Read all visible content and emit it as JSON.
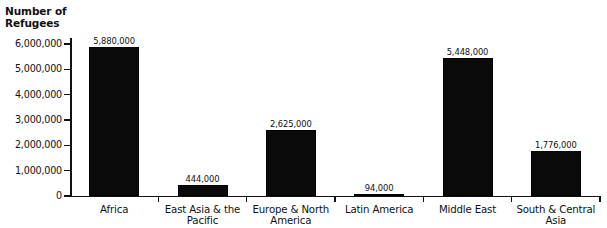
{
  "chart_data": {
    "type": "bar",
    "title": "",
    "xlabel": "",
    "ylabel": "Number of\nRefugees",
    "ylim": [
      0,
      6000000
    ],
    "ytick_labels": [
      "6,000,000",
      "5,000,000",
      "4,000,000",
      "3,000,000",
      "2,000,000",
      "1,000,000",
      "0"
    ],
    "ytick_values": [
      6000000,
      5000000,
      4000000,
      3000000,
      2000000,
      1000000,
      0
    ],
    "grid": false,
    "legend": "none",
    "bar_color": "#0a0a0a",
    "categories": [
      "Africa",
      "East Asia & the\nPacific",
      "Europe & North\nAmerica",
      "Latin America",
      "Middle East",
      "South & Central\nAsia"
    ],
    "values": [
      5880000,
      444000,
      2625000,
      94000,
      5448000,
      1776000
    ],
    "value_labels": [
      "5,880,000",
      "444,000",
      "2,625,000",
      "94,000",
      "5,448,000",
      "1,776,000"
    ]
  }
}
